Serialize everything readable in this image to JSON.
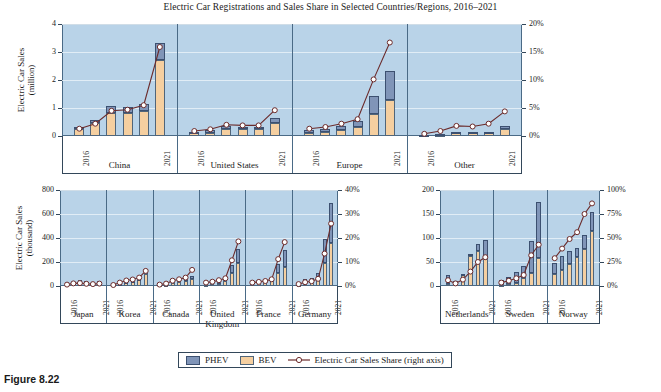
{
  "figure": {
    "caption": "Figure 8.22",
    "title": "Electric Car Registrations and Sales Share in Selected Countries/Regions, 2016–2021"
  },
  "legend": {
    "phev_label": "PHEV",
    "bev_label": "BEV",
    "share_label": "Electric Car Sales Share (right axis)"
  },
  "colors": {
    "phev": "#8095b8",
    "bev": "#f5cfa0",
    "line": "#6b2b2b",
    "plot_bg": "#b9d3e8",
    "axis": "#33475a"
  },
  "chart_data": [
    {
      "type": "bar",
      "id": "top",
      "title": "Electric Car Registrations and Sales Share in Selected Countries/Regions, 2016–2021",
      "ylabel": "Electric Car Sales (million)",
      "ylabel_line1": "Electric Car Sales",
      "ylabel_line2": "(million)",
      "ylim": [
        0,
        4
      ],
      "yticks": [
        "0",
        "1",
        "2",
        "3",
        "4"
      ],
      "y2label": "Electric Car Sales Share (right axis)",
      "y2lim": [
        0,
        20
      ],
      "y2ticks": [
        "0%",
        "5%",
        "10%",
        "15%",
        "20%"
      ],
      "grid": true,
      "legend_position": "bottom",
      "x_first": "2016",
      "x_last": "2021",
      "years": [
        2016,
        2017,
        2018,
        2019,
        2020,
        2021
      ],
      "groups": [
        {
          "name": "China",
          "bev": [
            0.26,
            0.47,
            0.82,
            0.83,
            0.9,
            2.73
          ],
          "phev": [
            0.07,
            0.11,
            0.25,
            0.22,
            0.23,
            0.6
          ],
          "share": [
            1.3,
            2.2,
            4.5,
            4.7,
            5.5,
            15.9
          ]
        },
        {
          "name": "United States",
          "bev": [
            0.09,
            0.12,
            0.24,
            0.24,
            0.24,
            0.45
          ],
          "phev": [
            0.07,
            0.1,
            0.12,
            0.09,
            0.08,
            0.18
          ],
          "share": [
            0.9,
            1.2,
            2.0,
            1.9,
            1.9,
            4.6
          ]
        },
        {
          "name": "Europe",
          "bev": [
            0.1,
            0.14,
            0.2,
            0.31,
            0.77,
            1.27
          ],
          "phev": [
            0.11,
            0.12,
            0.16,
            0.24,
            0.66,
            1.06
          ],
          "share": [
            1.3,
            1.6,
            2.2,
            3.0,
            10.1,
            16.7
          ]
        },
        {
          "name": "Other",
          "bev": [
            0.03,
            0.05,
            0.09,
            0.1,
            0.11,
            0.26
          ],
          "phev": [
            0.02,
            0.03,
            0.04,
            0.04,
            0.04,
            0.08
          ],
          "share": [
            0.4,
            0.9,
            1.8,
            1.7,
            2.2,
            4.4
          ]
        }
      ]
    },
    {
      "type": "bar",
      "id": "bottom_left",
      "ylabel": "Electric Car Sales (thousand)",
      "ylabel_line1": "Electric Car Sales",
      "ylabel_line2": "(thousand)",
      "ylim": [
        0,
        800
      ],
      "yticks": [
        "0",
        "200",
        "400",
        "600",
        "800"
      ],
      "y2lim": [
        0,
        40
      ],
      "y2ticks": [
        "0%",
        "10%",
        "20%",
        "30%",
        "40%"
      ],
      "grid": true,
      "x_first": "2016",
      "x_last": "2021",
      "years": [
        2016,
        2017,
        2018,
        2019,
        2020,
        2021
      ],
      "groups": [
        {
          "name": "Japan",
          "bev": [
            15,
            18,
            27,
            21,
            15,
            21
          ],
          "phev": [
            9,
            17,
            25,
            18,
            15,
            22
          ],
          "share": [
            0.6,
            1.1,
            1.2,
            0.9,
            0.8,
            1.0
          ]
        },
        {
          "name": "Korea",
          "bev": [
            5,
            14,
            31,
            35,
            47,
            101
          ],
          "phev": [
            1,
            3,
            6,
            5,
            8,
            20
          ],
          "share": [
            0.4,
            1.4,
            2.3,
            2.7,
            3.5,
            6.3
          ]
        },
        {
          "name": "Canada",
          "bev": [
            5,
            9,
            21,
            35,
            39,
            60
          ],
          "phev": [
            5,
            9,
            20,
            16,
            16,
            25
          ],
          "share": [
            0.6,
            1.0,
            2.2,
            2.8,
            3.5,
            6.7
          ]
        },
        {
          "name": "United Kingdom",
          "name_line1": "United",
          "name_line2": "Kingdom",
          "bev": [
            11,
            14,
            16,
            38,
            109,
            190
          ],
          "phev": [
            26,
            32,
            43,
            35,
            69,
            115
          ],
          "share": [
            1.4,
            1.8,
            2.4,
            3.2,
            10.7,
            18.6
          ]
        },
        {
          "name": "France",
          "bev": [
            21,
            25,
            31,
            43,
            111,
            162
          ],
          "phev": [
            7,
            10,
            14,
            19,
            73,
            141
          ],
          "share": [
            1.4,
            1.7,
            2.1,
            2.8,
            11.2,
            18.3
          ]
        },
        {
          "name": "Germany",
          "bev": [
            11,
            25,
            36,
            63,
            194,
            356
          ],
          "phev": [
            13,
            30,
            32,
            46,
            200,
            335
          ],
          "share": [
            0.8,
            1.6,
            2.0,
            3.0,
            13.5,
            26.0
          ]
        }
      ]
    },
    {
      "type": "bar",
      "id": "bottom_right",
      "ylim": [
        0,
        200
      ],
      "yticks": [
        "0",
        "50",
        "100",
        "150",
        "200"
      ],
      "y2lim": [
        0,
        100
      ],
      "y2ticks": [
        "0%",
        "25%",
        "50%",
        "75%",
        "100%"
      ],
      "grid": true,
      "x_first": "2016",
      "x_last": "2021",
      "years": [
        2016,
        2017,
        2018,
        2019,
        2020,
        2021
      ],
      "groups": [
        {
          "name": "Netherlands",
          "bev": [
            4,
            8,
            24,
            62,
            73,
            56
          ],
          "phev": [
            18,
            2,
            2,
            5,
            15,
            40
          ],
          "share": [
            6.0,
            2.7,
            6.7,
            15.0,
            25.0,
            30.0
          ]
        },
        {
          "name": "Sweden",
          "bev": [
            3,
            5,
            7,
            16,
            28,
            58
          ],
          "phev": [
            10,
            14,
            22,
            25,
            66,
            117
          ],
          "share": [
            3.5,
            5.5,
            8.0,
            11.5,
            32.0,
            43.0
          ]
        },
        {
          "name": "Norway",
          "bev": [
            25,
            33,
            46,
            60,
            77,
            114
          ],
          "phev": [
            23,
            30,
            27,
            19,
            29,
            40
          ],
          "share": [
            29.0,
            39.0,
            49.0,
            56.0,
            75.0,
            86.0
          ]
        }
      ]
    }
  ]
}
